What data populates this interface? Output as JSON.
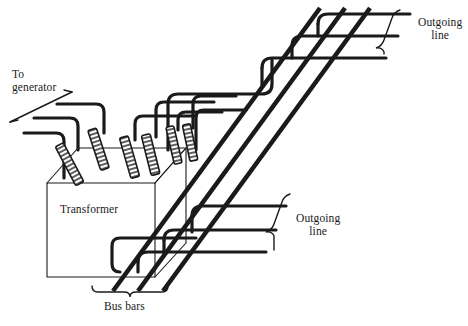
{
  "figure": {
    "domain": "diagram",
    "kind": "isometric-line-drawing",
    "background_color": "#ffffff",
    "ink_color": "#1a1a1a",
    "caption": ""
  },
  "labels": {
    "to_generator": "To\ngenerator",
    "outgoing_line_top": "Outgoing\nline",
    "outgoing_line_bottom": "Outgoing\nline",
    "transformer": "Transformer",
    "bus_bars": "Bus bars"
  },
  "components": {
    "transformer": {
      "name": "Transformer",
      "shape": "isometric box",
      "top_face": [
        [
          47,
          183
        ],
        [
          78,
          148
        ],
        [
          186,
          148
        ],
        [
          155,
          183
        ]
      ],
      "front_face": [
        [
          47,
          183
        ],
        [
          155,
          183
        ],
        [
          155,
          277
        ],
        [
          47,
          277
        ]
      ],
      "side_face": [
        [
          155,
          183
        ],
        [
          186,
          148
        ],
        [
          186,
          243
        ],
        [
          155,
          277
        ]
      ]
    },
    "bushings": {
      "count": 6,
      "style": "ribbed insulator cylinder",
      "items": [
        {
          "x1": 63,
          "y1": 178,
          "x2": 78,
          "y2": 150,
          "width": 6
        },
        {
          "x1": 93,
          "y1": 165,
          "x2": 104,
          "y2": 133,
          "width": 6
        },
        {
          "x1": 125,
          "y1": 175,
          "x2": 135,
          "y2": 140,
          "width": 6
        },
        {
          "x1": 146,
          "y1": 172,
          "x2": 156,
          "y2": 137,
          "width": 6
        },
        {
          "x1": 170,
          "y1": 160,
          "x2": 178,
          "y2": 130,
          "width": 5
        },
        {
          "x1": 186,
          "y1": 157,
          "x2": 193,
          "y2": 128,
          "width": 5
        }
      ]
    },
    "bus_bars": {
      "count": 3,
      "style": "thick diagonal conductor",
      "stroke_width": 4.6,
      "direction": "lower-left to upper-right",
      "items": [
        {
          "x1": 112,
          "y1": 290,
          "x2": 320,
          "y2": 10
        },
        {
          "x1": 137,
          "y1": 290,
          "x2": 344,
          "y2": 10
        },
        {
          "x1": 162,
          "y1": 290,
          "x2": 368,
          "y2": 10
        }
      ]
    },
    "incoming_conductors": {
      "count": 3,
      "source": "generator",
      "side": "left",
      "stroke_width": 3.2
    },
    "outgoing_conductors_top": {
      "count": 3,
      "side": "upper-right",
      "stroke_width": 3.2
    },
    "outgoing_conductors_bottom": {
      "count": 3,
      "side": "lower-right",
      "stroke_width": 3.2
    },
    "brackets": {
      "bus_bars_brace": {
        "orientation": "horizontal-below",
        "x1": 92,
        "x2": 168,
        "y": 290
      },
      "outgoing_top_brace": {
        "orientation": "diagonal-right",
        "x1": 398,
        "y1": 12,
        "x2": 380,
        "y2": 54
      },
      "outgoing_bottom_brace": {
        "orientation": "diagonal-right",
        "x1": 288,
        "y1": 196,
        "x2": 268,
        "y2": 248
      }
    },
    "leader_line_to_generator": {
      "x1": 10,
      "y1": 122,
      "x2": 72,
      "y2": 92
    }
  }
}
